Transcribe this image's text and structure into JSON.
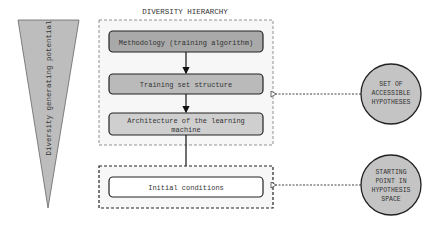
{
  "title": "DIVERSITY HIERARCHY",
  "triangle": {
    "label": "Diversity generating potential",
    "fill": "#bdbdbd"
  },
  "hierarchy": [
    {
      "label": "Methodology (training algorithm)",
      "fill": "#a9a9a9"
    },
    {
      "label": "Training set structure",
      "fill": "#bababa"
    },
    {
      "label_lines": [
        "Architecture of the learning",
        "machine"
      ],
      "fill": "#cfcfcf"
    }
  ],
  "initial": {
    "label": "Initial conditions",
    "fill": "#ffffff"
  },
  "circles": [
    {
      "lines": [
        "SET OF",
        "ACCESSIBLE",
        "HYPOTHESES"
      ],
      "fill": "#c4c4c4"
    },
    {
      "lines": [
        "STARTING",
        "POINT IN",
        "HYPOTHESIS",
        "SPACE"
      ],
      "fill": "#c4c4c4"
    }
  ]
}
